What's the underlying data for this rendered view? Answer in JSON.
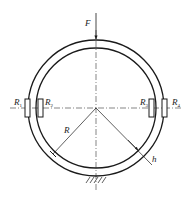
{
  "figure": {
    "type": "ring-with-strain-gauges",
    "labels": {
      "force": "F",
      "radius": "R",
      "thickness": "h",
      "gauges": [
        {
          "main": "R",
          "sub": "1"
        },
        {
          "main": "R",
          "sub": "2"
        },
        {
          "main": "R",
          "sub": "3"
        },
        {
          "main": "R",
          "sub": "4"
        }
      ]
    },
    "colors": {
      "stroke": "#1a1a1a",
      "background": "#ffffff"
    }
  }
}
